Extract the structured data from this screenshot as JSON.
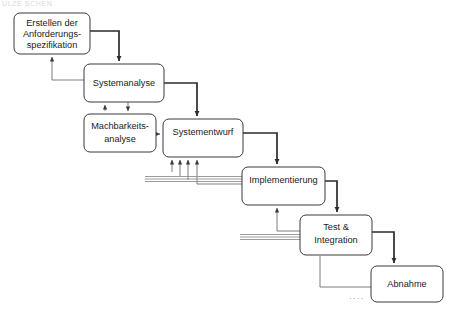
{
  "diagram": {
    "title_fragment": "ULZE SCHEN",
    "type": "waterfall-process-flow",
    "language": "de",
    "colors": {
      "box_stroke": "#3a3a3a",
      "box_fill": "#ffffff",
      "text": "#1a1a1a",
      "flow_arrow": "#2b2b2b",
      "feedback_line": "#8f8f8f",
      "ellipsis": "#9a9a9a",
      "background": "#ffffff"
    },
    "nodes": [
      {
        "id": "anforderungsspezifikation",
        "lines": [
          "Erstellen der",
          "Anforderungs-",
          "spezifikation"
        ],
        "x": 14,
        "y": 13,
        "w": 76,
        "h": 41
      },
      {
        "id": "systemanalyse",
        "lines": [
          "Systemanalyse"
        ],
        "x": 84,
        "y": 64,
        "w": 80,
        "h": 38
      },
      {
        "id": "machbarkeitsanalyse",
        "lines": [
          "Machbarkeits-",
          "analyse"
        ],
        "x": 84,
        "y": 114,
        "w": 72,
        "h": 38
      },
      {
        "id": "systementwurf",
        "lines": [
          "Systementwurf"
        ],
        "x": 163,
        "y": 119,
        "w": 80,
        "h": 38
      },
      {
        "id": "implementierung",
        "lines": [
          "Implementierung"
        ],
        "x": 242,
        "y": 167,
        "w": 83,
        "h": 38
      },
      {
        "id": "test-integration",
        "lines": [
          "Test &",
          "Integration"
        ],
        "x": 300,
        "y": 215,
        "w": 72,
        "h": 40
      },
      {
        "id": "abnahme",
        "lines": [
          "Abnahme"
        ],
        "x": 371,
        "y": 266,
        "w": 72,
        "h": 36
      }
    ],
    "ellipsis": {
      "label": "....",
      "x": 357,
      "y": 297
    },
    "edges": [
      {
        "id": "anforderung-to-systemanalyse",
        "kind": "flow"
      },
      {
        "id": "systemanalyse-to-anforderung",
        "kind": "feedback-up"
      },
      {
        "id": "systemanalyse-to-machbarkeit",
        "kind": "flow-down"
      },
      {
        "id": "machbarkeit-to-systemanalyse",
        "kind": "feedback-up"
      },
      {
        "id": "machbarkeit-to-systementwurf",
        "kind": "flow-right"
      },
      {
        "id": "systemanalyse-to-systementwurf",
        "kind": "flow"
      },
      {
        "id": "systementwurf-to-implementierung",
        "kind": "flow"
      },
      {
        "id": "implementierung-to-systementwurf",
        "kind": "feedback-multi"
      },
      {
        "id": "implementierung-to-test",
        "kind": "flow"
      },
      {
        "id": "test-to-implementierung",
        "kind": "feedback-multi"
      },
      {
        "id": "test-to-abnahme",
        "kind": "flow"
      },
      {
        "id": "abnahme-to-test",
        "kind": "feedback"
      }
    ]
  }
}
